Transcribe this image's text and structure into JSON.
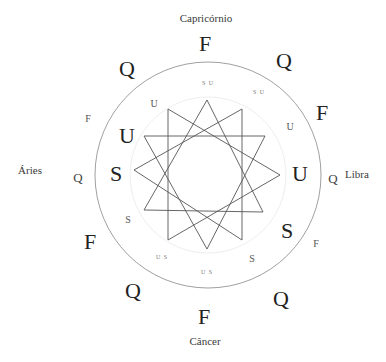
{
  "diagram": {
    "title": "",
    "signs": {
      "top": "Capricórnio",
      "right": "Libra",
      "bottom": "Câncer",
      "left": "Áries"
    },
    "outer_ring": [
      {
        "text": "F",
        "x": 205,
        "y": 44,
        "size": "big"
      },
      {
        "text": "Q",
        "x": 284,
        "y": 61,
        "size": "big"
      },
      {
        "text": "F",
        "x": 322,
        "y": 113,
        "size": "big"
      },
      {
        "text": "Q",
        "x": 333,
        "y": 178,
        "size": "mid"
      },
      {
        "text": "F",
        "x": 316,
        "y": 244,
        "size": "small"
      },
      {
        "text": "Q",
        "x": 281,
        "y": 299,
        "size": "big"
      },
      {
        "text": "F",
        "x": 204,
        "y": 317,
        "size": "big"
      },
      {
        "text": "Q",
        "x": 133,
        "y": 291,
        "size": "big"
      },
      {
        "text": "F",
        "x": 90,
        "y": 242,
        "size": "big"
      },
      {
        "text": "Q",
        "x": 78,
        "y": 177,
        "size": "mid"
      },
      {
        "text": "F",
        "x": 88,
        "y": 119,
        "size": "small"
      },
      {
        "text": "Q",
        "x": 127,
        "y": 69,
        "size": "big"
      }
    ],
    "inner_ring": [
      {
        "text": "S U",
        "x": 208,
        "y": 83,
        "size": "tiny"
      },
      {
        "text": "S U",
        "x": 259,
        "y": 92,
        "size": "tiny"
      },
      {
        "text": "U",
        "x": 290,
        "y": 127,
        "size": "small"
      },
      {
        "text": "U",
        "x": 300,
        "y": 174,
        "size": "big"
      },
      {
        "text": "S",
        "x": 287,
        "y": 231,
        "size": "big"
      },
      {
        "text": "S",
        "x": 252,
        "y": 259,
        "size": "small"
      },
      {
        "text": "U S",
        "x": 207,
        "y": 272,
        "size": "tiny"
      },
      {
        "text": "U S",
        "x": 162,
        "y": 257,
        "size": "tiny"
      },
      {
        "text": "S",
        "x": 128,
        "y": 220,
        "size": "small"
      },
      {
        "text": "S",
        "x": 116,
        "y": 174,
        "size": "big"
      },
      {
        "text": "U",
        "x": 127,
        "y": 136,
        "size": "big"
      },
      {
        "text": "U",
        "x": 154,
        "y": 104,
        "size": "small"
      }
    ],
    "circle": {
      "cx": 208,
      "cy": 175,
      "r": 113,
      "stroke": "#888888"
    },
    "inner_guide": {
      "cx": 208,
      "cy": 175,
      "r": 78,
      "stroke": "#eeeeee"
    },
    "star": {
      "cx": 207,
      "cy": 174,
      "r": 74,
      "points": 12,
      "step": 4,
      "stroke": "#555555",
      "vertices": [
        [
          207,
          100
        ],
        [
          242,
          109
        ],
        [
          265,
          136
        ],
        [
          280,
          175
        ],
        [
          263,
          212
        ],
        [
          242,
          240
        ],
        [
          207,
          249
        ],
        [
          168,
          240
        ],
        [
          144,
          210
        ],
        [
          134,
          170
        ],
        [
          144,
          136
        ],
        [
          168,
          109
        ]
      ]
    }
  }
}
